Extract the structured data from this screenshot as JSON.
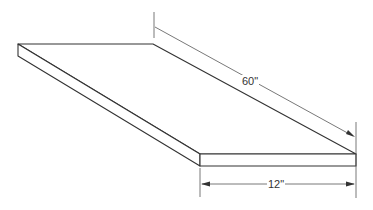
{
  "diagram": {
    "type": "isometric-board",
    "colors": {
      "line": "#333333",
      "dim_line": "#555555",
      "background": "#ffffff"
    },
    "dimensions": [
      {
        "id": "length",
        "label": "60\""
      },
      {
        "id": "width",
        "label": "12\""
      }
    ]
  }
}
